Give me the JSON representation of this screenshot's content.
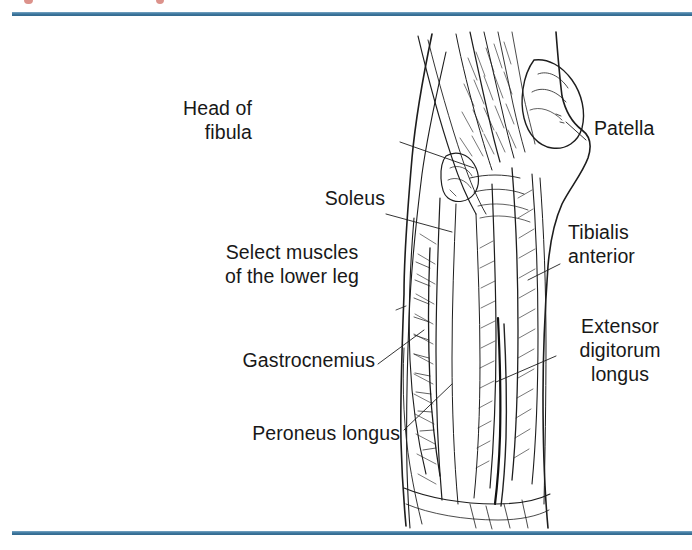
{
  "page": {
    "type": "textbook-figure",
    "background_color": "#ffffff",
    "rule_color": "#3a769e"
  },
  "figure": {
    "subject": "Select muscles of the lower leg",
    "style": "pen-and-ink anatomical line drawing",
    "view": "anterolateral view of right lower leg and knee"
  },
  "caption": {
    "line1": "Select muscles",
    "line2": "of the lower leg"
  },
  "labels": [
    {
      "id": "head-of-fibula",
      "line1": "Head of",
      "line2": "fibula",
      "line3": "",
      "side": "left"
    },
    {
      "id": "patella",
      "line1": "Patella",
      "line2": "",
      "line3": "",
      "side": "right"
    },
    {
      "id": "soleus",
      "line1": "Soleus",
      "line2": "",
      "line3": "",
      "side": "left"
    },
    {
      "id": "tibialis-anterior",
      "line1": "Tibialis",
      "line2": "anterior",
      "line3": "",
      "side": "right"
    },
    {
      "id": "gastrocnemius",
      "line1": "Gastrocnemius",
      "line2": "",
      "line3": "",
      "side": "left"
    },
    {
      "id": "extensor-digitorum-longus",
      "line1": "Extensor",
      "line2": "digitorum",
      "line3": "longus",
      "side": "right"
    },
    {
      "id": "peroneus-longus",
      "line1": "Peroneus longus",
      "line2": "",
      "line3": "",
      "side": "left"
    }
  ],
  "label_text": {
    "head_of_fibula_1": "Head of",
    "head_of_fibula_2": "fibula",
    "patella": "Patella",
    "soleus": "Soleus",
    "tibialis_1": "Tibialis",
    "tibialis_2": "anterior",
    "gastrocnemius": "Gastrocnemius",
    "extensor_1": "Extensor",
    "extensor_2": "digitorum",
    "extensor_3": "longus",
    "peroneus_longus": "Peroneus longus"
  }
}
